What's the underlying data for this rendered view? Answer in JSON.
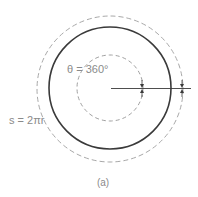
{
  "figure": {
    "caption": "(a)",
    "labels": {
      "theta": "θ = 360°",
      "arc_length": "s = 2πr"
    },
    "colors": {
      "solid_circle": "#3a3a3a",
      "dashed_circle": "#a0a0a0",
      "radius_line": "#3a3a3a",
      "text": "#8a8a8a"
    },
    "elements": [
      {
        "type": "circle",
        "style": "solid",
        "role": "circle-of-radius-r"
      },
      {
        "type": "circle",
        "style": "dashed",
        "role": "outer-dashed-circle"
      },
      {
        "type": "circle",
        "style": "dashed",
        "role": "inner-dashed-circle"
      },
      {
        "type": "line",
        "role": "radius-line"
      },
      {
        "type": "arrow-pair",
        "role": "inner-dimension-arrows"
      },
      {
        "type": "arrow-pair",
        "role": "outer-dimension-arrows"
      }
    ]
  }
}
